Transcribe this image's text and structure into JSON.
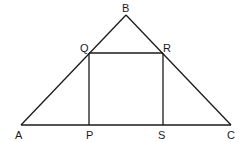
{
  "diagram": {
    "type": "geometry",
    "stroke_color": "#1a1a1a",
    "points": {
      "A": {
        "label": "A",
        "x": 21,
        "y": 125
      },
      "B": {
        "label": "B",
        "x": 126,
        "y": 15
      },
      "C": {
        "label": "C",
        "x": 231,
        "y": 125
      },
      "Q": {
        "label": "Q",
        "x": 89,
        "y": 53
      },
      "R": {
        "label": "R",
        "x": 163,
        "y": 53
      },
      "P": {
        "label": "P",
        "x": 89,
        "y": 125
      },
      "S": {
        "label": "S",
        "x": 163,
        "y": 125
      }
    },
    "segments": [
      "AB",
      "BC",
      "AC",
      "QR",
      "QP",
      "RS"
    ]
  }
}
